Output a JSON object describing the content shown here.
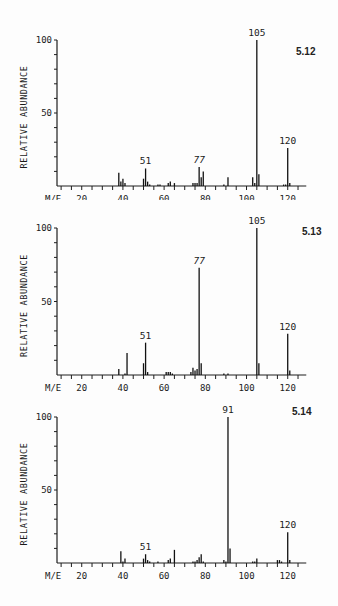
{
  "chart_data": [
    {
      "type": "bar",
      "title": "5.12",
      "xlabel": "M/E",
      "ylabel": "RELATIVE ABUNDANCE",
      "xlim": [
        8,
        129
      ],
      "ylim": [
        0,
        100
      ],
      "x_ticks": [
        20,
        40,
        60,
        80,
        100,
        120
      ],
      "y_ticks": [
        50,
        100
      ],
      "grid": false,
      "annotations": [
        {
          "x": 51,
          "label": "51"
        },
        {
          "x": 77,
          "label": "77",
          "italic": true
        },
        {
          "x": 105,
          "label": "105"
        },
        {
          "x": 120,
          "label": "120"
        }
      ],
      "peaks": [
        [
          38,
          9
        ],
        [
          39,
          3
        ],
        [
          40,
          5
        ],
        [
          41,
          2
        ],
        [
          50,
          5
        ],
        [
          51,
          12
        ],
        [
          52,
          3
        ],
        [
          53,
          1
        ],
        [
          57,
          1
        ],
        [
          58,
          1
        ],
        [
          62,
          2
        ],
        [
          63,
          3
        ],
        [
          65,
          2
        ],
        [
          74,
          2
        ],
        [
          75,
          2
        ],
        [
          76,
          2
        ],
        [
          77,
          13
        ],
        [
          78,
          6
        ],
        [
          79,
          10
        ],
        [
          89,
          1
        ],
        [
          91,
          6
        ],
        [
          103,
          6
        ],
        [
          104,
          2
        ],
        [
          105,
          100
        ],
        [
          106,
          8
        ],
        [
          118,
          1
        ],
        [
          119,
          1
        ],
        [
          120,
          26
        ],
        [
          121,
          2
        ]
      ]
    },
    {
      "type": "bar",
      "title": "5.13",
      "xlabel": "M/E",
      "ylabel": "RELATIVE ABUNDANCE",
      "xlim": [
        8,
        129
      ],
      "ylim": [
        0,
        100
      ],
      "x_ticks": [
        20,
        40,
        60,
        80,
        100,
        120
      ],
      "y_ticks": [
        50,
        100
      ],
      "grid": false,
      "annotations": [
        {
          "x": 51,
          "label": "51"
        },
        {
          "x": 77,
          "label": "77",
          "italic": true
        },
        {
          "x": 105,
          "label": "105"
        },
        {
          "x": 120,
          "label": "120"
        }
      ],
      "peaks": [
        [
          38,
          4
        ],
        [
          41,
          1
        ],
        [
          42,
          15
        ],
        [
          50,
          8
        ],
        [
          51,
          22
        ],
        [
          52,
          2
        ],
        [
          61,
          2
        ],
        [
          62,
          2
        ],
        [
          63,
          2
        ],
        [
          64,
          1
        ],
        [
          73,
          2
        ],
        [
          74,
          5
        ],
        [
          75,
          3
        ],
        [
          76,
          4
        ],
        [
          77,
          73
        ],
        [
          78,
          8
        ],
        [
          89,
          1
        ],
        [
          91,
          1
        ],
        [
          105,
          100
        ],
        [
          106,
          8
        ],
        [
          120,
          28
        ],
        [
          121,
          3
        ]
      ]
    },
    {
      "type": "bar",
      "title": "5.14",
      "xlabel": "M/E",
      "ylabel": "RELATIVE ABUNDANCE",
      "xlim": [
        8,
        129
      ],
      "ylim": [
        0,
        100
      ],
      "x_ticks": [
        20,
        40,
        60,
        80,
        100,
        120
      ],
      "y_ticks": [
        50,
        100
      ],
      "grid": false,
      "annotations": [
        {
          "x": 51,
          "label": "51"
        },
        {
          "x": 91,
          "label": "91"
        },
        {
          "x": 120,
          "label": "120"
        }
      ],
      "peaks": [
        [
          39,
          8
        ],
        [
          40,
          1
        ],
        [
          41,
          3
        ],
        [
          50,
          3
        ],
        [
          51,
          6
        ],
        [
          52,
          2
        ],
        [
          53,
          1
        ],
        [
          57,
          1
        ],
        [
          62,
          2
        ],
        [
          63,
          3
        ],
        [
          65,
          9
        ],
        [
          74,
          1
        ],
        [
          75,
          1
        ],
        [
          76,
          2
        ],
        [
          77,
          4
        ],
        [
          78,
          6
        ],
        [
          79,
          1
        ],
        [
          89,
          2
        ],
        [
          90,
          1
        ],
        [
          91,
          100
        ],
        [
          92,
          10
        ],
        [
          103,
          1
        ],
        [
          104,
          1
        ],
        [
          105,
          3
        ],
        [
          115,
          2
        ],
        [
          116,
          2
        ],
        [
          117,
          1
        ],
        [
          120,
          21
        ],
        [
          121,
          2
        ]
      ]
    }
  ],
  "figures": [
    {
      "label": "5.12"
    },
    {
      "label": "5.13"
    },
    {
      "label": "5.14"
    }
  ]
}
